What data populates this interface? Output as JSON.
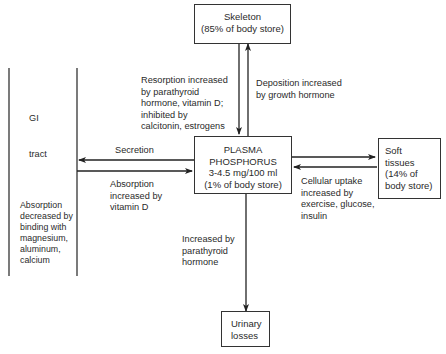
{
  "diagram": {
    "nodes": {
      "skeleton": {
        "line1": "Skeleton",
        "line2": "(85% of body store)"
      },
      "plasma": {
        "line1": "PLASMA",
        "line2": "PHOSPHORUS",
        "line3": "3-4.5 mg/100 ml",
        "line4": "(1% of body store)"
      },
      "soft_tissues": {
        "line1": "Soft",
        "line2": "tissues",
        "line3": "(14% of",
        "line4": "body store)"
      },
      "urinary": {
        "line1": "Urinary",
        "line2": "losses"
      },
      "gi_tract": {
        "line1": "GI",
        "line2": "tract"
      }
    },
    "labels": {
      "resorption": "Resorption increased\nby parathyroid\nhormone, vitamin D;\ninhibited by\ncalcitonin, estrogens",
      "deposition": "Deposition increased\nby growth hormone",
      "secretion": "Secretion",
      "absorption_increased": "Absorption\nincreased by\nvitamin D",
      "absorption_decreased": "Absorption\ndecreased by\nbinding with\nmagnesium,\naluminum,\ncalcium",
      "cellular_uptake": "Cellular uptake\nincreased by\nexercise, glucose,\ninsulin",
      "urinary_increased": "Increased by\nparathyroid\nhormone"
    },
    "edges": [
      {
        "from": "skeleton",
        "to": "plasma",
        "label": "resorption"
      },
      {
        "from": "plasma",
        "to": "skeleton",
        "label": "deposition"
      },
      {
        "from": "plasma",
        "to": "gi_tract",
        "label": "secretion"
      },
      {
        "from": "gi_tract",
        "to": "plasma",
        "label": "absorption_increased"
      },
      {
        "from": "plasma",
        "to": "soft_tissues",
        "label": "cellular_uptake"
      },
      {
        "from": "soft_tissues",
        "to": "plasma",
        "label": ""
      },
      {
        "from": "plasma",
        "to": "urinary",
        "label": "urinary_increased"
      }
    ]
  }
}
